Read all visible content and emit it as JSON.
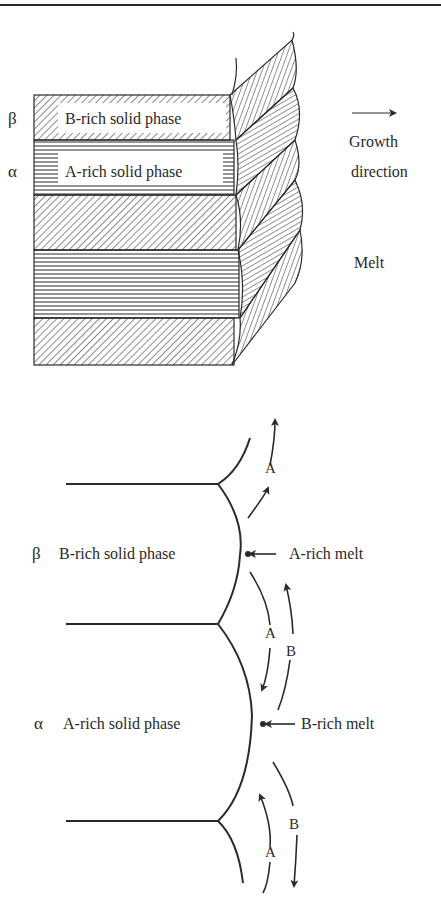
{
  "top_panel": {
    "phase_beta_symbol": "β",
    "phase_beta_label": "B-rich solid phase",
    "phase_alpha_symbol": "α",
    "phase_alpha_label": "A-rich solid phase",
    "growth_label_line1": "Growth",
    "growth_label_line2": "direction",
    "melt_label": "Melt"
  },
  "bottom_panel": {
    "beta_symbol": "β",
    "beta_label": "B-rich solid phase",
    "alpha_symbol": "α",
    "alpha_label": "A-rich solid phase",
    "a_rich_melt_label": "A-rich melt",
    "b_rich_melt_label": "B-rich melt",
    "diffusion_labels": [
      "A",
      "A",
      "B",
      "B",
      "A"
    ]
  },
  "colors": {
    "line": "#2a2a2a",
    "background": "#ffffff"
  }
}
